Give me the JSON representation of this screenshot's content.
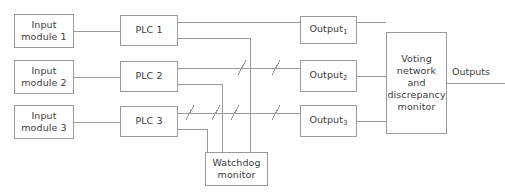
{
  "diagram": {
    "stroke_color": "#9a9a9a",
    "text_color": "#3c3c3c",
    "background_color": "#ffffff",
    "input_modules": [
      {
        "id": "input-module-1",
        "line1": "Input",
        "line2": "module 1"
      },
      {
        "id": "input-module-2",
        "line1": "Input",
        "line2": "module 2"
      },
      {
        "id": "input-module-3",
        "line1": "Input",
        "line2": "module 3"
      }
    ],
    "plcs": [
      {
        "id": "plc-1",
        "label": "PLC 1"
      },
      {
        "id": "plc-2",
        "label": "PLC 2"
      },
      {
        "id": "plc-3",
        "label": "PLC 3"
      }
    ],
    "outputs": [
      {
        "id": "output-1",
        "base": "Output",
        "subscript": "1"
      },
      {
        "id": "output-2",
        "base": "Output",
        "subscript": "2"
      },
      {
        "id": "output-3",
        "base": "Output",
        "subscript": "3"
      }
    ],
    "voting_network": {
      "id": "voting-network-and-discrepancy-monitor",
      "line1": "Voting",
      "line2": "network",
      "line3": "and",
      "line4": "discrepancy",
      "line5": "monitor"
    },
    "watchdog": {
      "id": "watchdog-monitor",
      "line1": "Watchdog",
      "line2": "monitor"
    },
    "outputs_terminal_label": "Outputs"
  }
}
